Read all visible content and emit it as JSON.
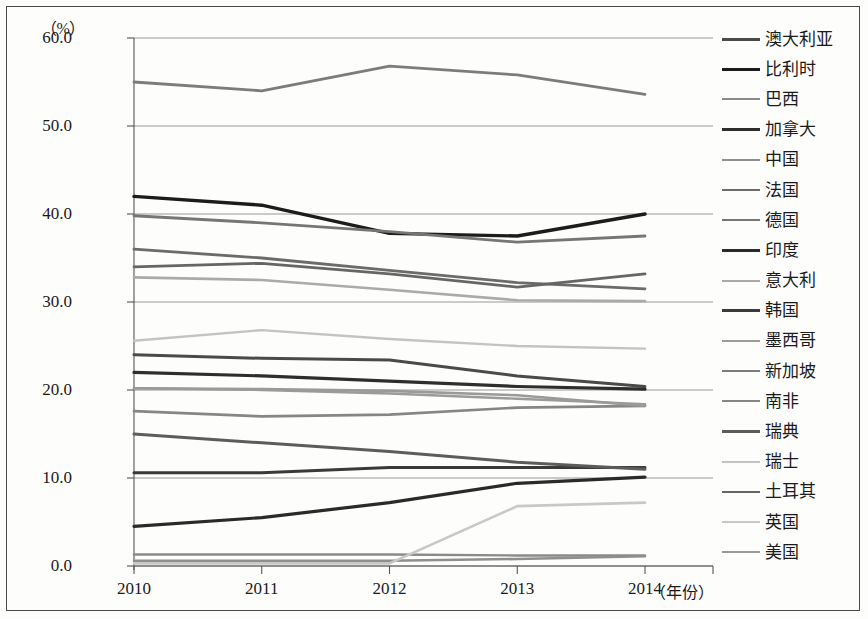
{
  "chart_data": {
    "type": "line",
    "title": "",
    "subtitle": "",
    "unit_label": "（%）",
    "xlabel": "（年份）",
    "ylabel": "",
    "categories": [
      "2010",
      "2011",
      "2012",
      "2013",
      "2014"
    ],
    "x": [
      2010,
      2011,
      2012,
      2013,
      2014
    ],
    "ylim": [
      0.0,
      60.0
    ],
    "ytick_labels": [
      "60.0",
      "50.0",
      "40.0",
      "30.0",
      "20.0",
      "10.0",
      "0.0"
    ],
    "ytick_values": [
      60.0,
      50.0,
      40.0,
      30.0,
      20.0,
      10.0,
      0.0
    ],
    "grid": "horizontal",
    "legend_position": "right",
    "series": [
      {
        "name": "澳大利亚",
        "color": "#4a4a4a",
        "width": 3.0,
        "values": [
          24.0,
          23.6,
          23.4,
          21.6,
          20.4
        ]
      },
      {
        "name": "比利时",
        "color": "#1c1c1c",
        "width": 3.4,
        "values": [
          42.0,
          41.0,
          37.8,
          37.5,
          40.0
        ]
      },
      {
        "name": "巴西",
        "color": "#8a8a8a",
        "width": 2.4,
        "values": [
          1.3,
          1.3,
          1.3,
          1.2,
          1.2
        ]
      },
      {
        "name": "加拿大",
        "color": "#2e2e2e",
        "width": 3.2,
        "values": [
          22.0,
          21.6,
          21.0,
          20.4,
          20.1
        ]
      },
      {
        "name": "中国",
        "color": "#8f8f8f",
        "width": 2.6,
        "values": [
          0.6,
          0.6,
          0.6,
          0.8,
          1.1
        ]
      },
      {
        "name": "法国",
        "color": "#6b6b6b",
        "width": 2.8,
        "values": [
          36.0,
          35.0,
          33.6,
          32.2,
          31.5
        ]
      },
      {
        "name": "德国",
        "color": "#767676",
        "width": 2.8,
        "values": [
          39.8,
          39.0,
          38.0,
          36.8,
          37.5
        ]
      },
      {
        "name": "印度",
        "color": "#2a2a2a",
        "width": 3.2,
        "values": [
          4.5,
          5.5,
          7.2,
          9.4,
          10.1
        ]
      },
      {
        "name": "意大利",
        "color": "#aaaaaa",
        "width": 2.6,
        "values": [
          32.8,
          32.5,
          31.4,
          30.2,
          30.1
        ]
      },
      {
        "name": "韩国",
        "color": "#3a3a3a",
        "width": 3.0,
        "values": [
          10.6,
          10.6,
          11.2,
          11.2,
          11.2
        ]
      },
      {
        "name": "墨西哥",
        "color": "#9b9b9b",
        "width": 2.4,
        "values": [
          20.2,
          20.0,
          19.6,
          19.0,
          18.4
        ]
      },
      {
        "name": "新加坡",
        "color": "#7c7c7c",
        "width": 2.8,
        "values": [
          55.0,
          54.0,
          56.8,
          55.8,
          53.6
        ]
      },
      {
        "name": "南非",
        "color": "#868686",
        "width": 2.6,
        "values": [
          17.6,
          17.0,
          17.2,
          18.0,
          18.2
        ]
      },
      {
        "name": "瑞典",
        "color": "#5c5c5c",
        "width": 3.0,
        "values": [
          15.0,
          14.0,
          13.0,
          11.8,
          11.0
        ]
      },
      {
        "name": "瑞士",
        "color": "#c3c3c3",
        "width": 2.4,
        "values": [
          25.6,
          26.8,
          25.8,
          25.0,
          24.7
        ]
      },
      {
        "name": "土耳其",
        "color": "#666666",
        "width": 2.8,
        "values": [
          34.0,
          34.4,
          33.2,
          31.7,
          33.2
        ]
      },
      {
        "name": "英国",
        "color": "#c8c8c8",
        "width": 2.6,
        "values": [
          0.3,
          0.3,
          0.3,
          6.8,
          7.2
        ]
      },
      {
        "name": "美国",
        "color": "#9a9a9a",
        "width": 2.6,
        "values": [
          20.2,
          20.1,
          19.9,
          19.4,
          18.2
        ]
      }
    ]
  }
}
